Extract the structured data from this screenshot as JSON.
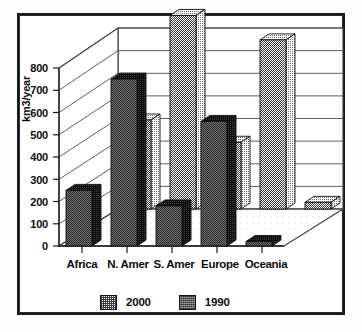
{
  "chart_data": {
    "type": "bar",
    "title": "",
    "subtitle": "",
    "xlabel": "",
    "ylabel": "km3/year",
    "categories": [
      "Africa",
      "N. Amer",
      "S. Amer",
      "Europe",
      "Oceania"
    ],
    "series": [
      {
        "name": "2000",
        "values": [
          400,
          870,
          300,
          760,
          30
        ],
        "color": "#8c8c8c"
      },
      {
        "name": "1990",
        "values": [
          250,
          750,
          180,
          560,
          20
        ],
        "color": "#2b2b2b"
      }
    ],
    "ylim": [
      0,
      800
    ],
    "ytick_step": 100,
    "yticks": [
      "800",
      "700",
      "600",
      "500",
      "400",
      "300",
      "200",
      "100",
      "0"
    ],
    "grid": true,
    "legend_position": "bottom",
    "projection": "3d",
    "annotations": []
  },
  "legend": {
    "items": [
      {
        "label": "2000",
        "swatch": "light-dither"
      },
      {
        "label": "1990",
        "swatch": "dark-dither"
      }
    ]
  },
  "axes": {
    "y_label": "km3/year",
    "y_ticks": [
      "800",
      "700",
      "600",
      "500",
      "400",
      "300",
      "200",
      "100",
      "0"
    ],
    "x_categories": [
      "Africa",
      "N. Amer",
      "S. Amer",
      "Europe",
      "Oceania"
    ]
  },
  "colors": {
    "background": "#ffffff",
    "frame": "#1a1a1a",
    "grid": "#4d4d4d",
    "series_2000": "#8c8c8c",
    "series_1990": "#2b2b2b",
    "text": "#0d0d0d"
  }
}
